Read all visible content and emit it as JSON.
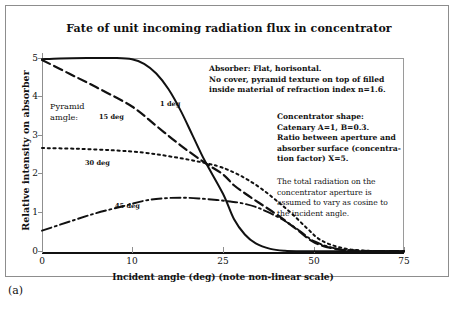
{
  "figure": {
    "caption": "(a)"
  },
  "chart_data": {
    "type": "line",
    "title": "Fate of unit incoming radiation flux in concentrator",
    "xlabel": "Incident angle (deg) (note non-linear scale)",
    "ylabel": "Relative intensity on absorber",
    "xtick_labels": [
      "0",
      "10",
      "25",
      "50",
      "75"
    ],
    "xtick_values": [
      0,
      10,
      25,
      50,
      75
    ],
    "ytick_labels": [
      "0",
      "1",
      "2",
      "3",
      "4",
      "5"
    ],
    "ytick_values": [
      0,
      1,
      2,
      3,
      4,
      5
    ],
    "ylim": [
      0,
      5
    ],
    "xlim": [
      0,
      75
    ],
    "xscale": "non-linear",
    "grid": false,
    "legend_position": "inline-curve-labels",
    "series": [
      {
        "name": "1 deg",
        "label": "1 deg",
        "style": "solid",
        "x": [
          0,
          2,
          5,
          8,
          10,
          12,
          14,
          16,
          18,
          20,
          22,
          25,
          28,
          31,
          34,
          38,
          42,
          46,
          50,
          55,
          62,
          75
        ],
        "y": [
          4.97,
          4.99,
          5.0,
          5.0,
          4.97,
          4.85,
          4.6,
          4.2,
          3.65,
          3.0,
          2.35,
          1.5,
          0.85,
          0.45,
          0.22,
          0.08,
          0.03,
          0.02,
          0.02,
          0.02,
          0.02,
          0.02
        ]
      },
      {
        "name": "15 deg",
        "label": "15 deg",
        "style": "dashed",
        "x": [
          0,
          3,
          6,
          10,
          14,
          18,
          22,
          25,
          28,
          32,
          36,
          40,
          45,
          50,
          56,
          63,
          75
        ],
        "y": [
          4.95,
          4.6,
          4.25,
          3.75,
          3.25,
          2.75,
          2.3,
          2.0,
          1.72,
          1.45,
          1.2,
          0.95,
          0.6,
          0.25,
          0.08,
          0.03,
          0.02
        ]
      },
      {
        "name": "30 deg",
        "label": "30 deg",
        "style": "dotted",
        "x": [
          0,
          4,
          8,
          12,
          16,
          20,
          24,
          28,
          32,
          36,
          40,
          44,
          48,
          52,
          58,
          65,
          75
        ],
        "y": [
          2.68,
          2.66,
          2.62,
          2.56,
          2.47,
          2.36,
          2.22,
          2.05,
          1.85,
          1.6,
          1.3,
          0.98,
          0.62,
          0.3,
          0.1,
          0.03,
          0.02
        ]
      },
      {
        "name": "45 deg",
        "label": "45 deg",
        "style": "dashdot",
        "x": [
          0,
          3,
          6,
          9,
          12,
          15,
          18,
          21,
          24,
          27,
          30,
          34,
          38,
          42,
          46,
          50,
          56,
          63,
          75
        ],
        "y": [
          0.55,
          0.78,
          1.0,
          1.18,
          1.32,
          1.38,
          1.4,
          1.38,
          1.34,
          1.3,
          1.26,
          1.16,
          1.0,
          0.8,
          0.55,
          0.28,
          0.09,
          0.03,
          0.02
        ]
      }
    ],
    "legend_heading": "Pyramid\namgle:",
    "annotations": [
      {
        "id": "absorber-note",
        "lines": [
          "Absorber: Flat, horisontal.",
          "No cover,  pyramid texture on top of filled",
          "inside material of refraction index n=1.6."
        ]
      },
      {
        "id": "concentrator-note",
        "lines": [
          "Concentrator shape:",
          "Catenary A=1, B=0.3.",
          "Ratio between aperture and",
          "absorber surface  (concentra-",
          "tion factor) X=5."
        ]
      },
      {
        "id": "radiation-note",
        "lines": [
          "The total radiation on the",
          "concentrator aperture is",
          "assumed to vary as cosine to",
          "the incident angle."
        ]
      }
    ]
  },
  "legend": {
    "heading_line1": "Pyramid",
    "heading_line2": "amgle:"
  },
  "colors": {
    "ink": "#111111",
    "frame": "#8f8f8f",
    "background": "#ffffff"
  }
}
